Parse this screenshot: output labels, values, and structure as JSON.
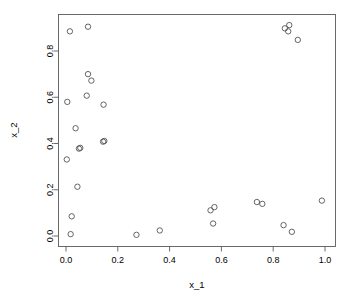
{
  "chart_data": {
    "type": "scatter",
    "title": "",
    "xlabel": "x_1",
    "ylabel": "x_2",
    "xlim": [
      -0.04,
      1.04
    ],
    "ylim": [
      -0.035,
      0.95
    ],
    "grid": false,
    "legend": null,
    "xticks": [
      "0.0",
      "0.2",
      "0.4",
      "0.6",
      "0.8",
      "1.0"
    ],
    "xtick_values": [
      0.0,
      0.2,
      0.4,
      0.6,
      0.8,
      1.0
    ],
    "yticks": [
      "0.0",
      "0.2",
      "0.4",
      "0.6",
      "0.8"
    ],
    "ytick_values": [
      0.0,
      0.2,
      0.4,
      0.6,
      0.8
    ],
    "marker": "open-circle",
    "marker_color": "#4a4a4a",
    "n_points": 30,
    "points": [
      {
        "x": 0.015,
        "y": 0.885
      },
      {
        "x": 0.085,
        "y": 0.905
      },
      {
        "x": 0.845,
        "y": 0.898
      },
      {
        "x": 0.862,
        "y": 0.912
      },
      {
        "x": 0.858,
        "y": 0.885
      },
      {
        "x": 0.895,
        "y": 0.848
      },
      {
        "x": 0.085,
        "y": 0.7
      },
      {
        "x": 0.098,
        "y": 0.672
      },
      {
        "x": 0.08,
        "y": 0.607
      },
      {
        "x": 0.005,
        "y": 0.58
      },
      {
        "x": 0.145,
        "y": 0.568
      },
      {
        "x": 0.037,
        "y": 0.466
      },
      {
        "x": 0.148,
        "y": 0.411
      },
      {
        "x": 0.143,
        "y": 0.408
      },
      {
        "x": 0.055,
        "y": 0.381
      },
      {
        "x": 0.05,
        "y": 0.378
      },
      {
        "x": 0.003,
        "y": 0.331
      },
      {
        "x": 0.044,
        "y": 0.213
      },
      {
        "x": 0.022,
        "y": 0.085
      },
      {
        "x": 0.018,
        "y": 0.008
      },
      {
        "x": 0.272,
        "y": 0.005
      },
      {
        "x": 0.362,
        "y": 0.024
      },
      {
        "x": 0.558,
        "y": 0.111
      },
      {
        "x": 0.573,
        "y": 0.125
      },
      {
        "x": 0.568,
        "y": 0.054
      },
      {
        "x": 0.737,
        "y": 0.147
      },
      {
        "x": 0.758,
        "y": 0.139
      },
      {
        "x": 0.84,
        "y": 0.047
      },
      {
        "x": 0.872,
        "y": 0.018
      },
      {
        "x": 0.988,
        "y": 0.153
      }
    ]
  },
  "labels": {
    "x_axis_title": "x_1",
    "y_axis_title": "x_2"
  }
}
